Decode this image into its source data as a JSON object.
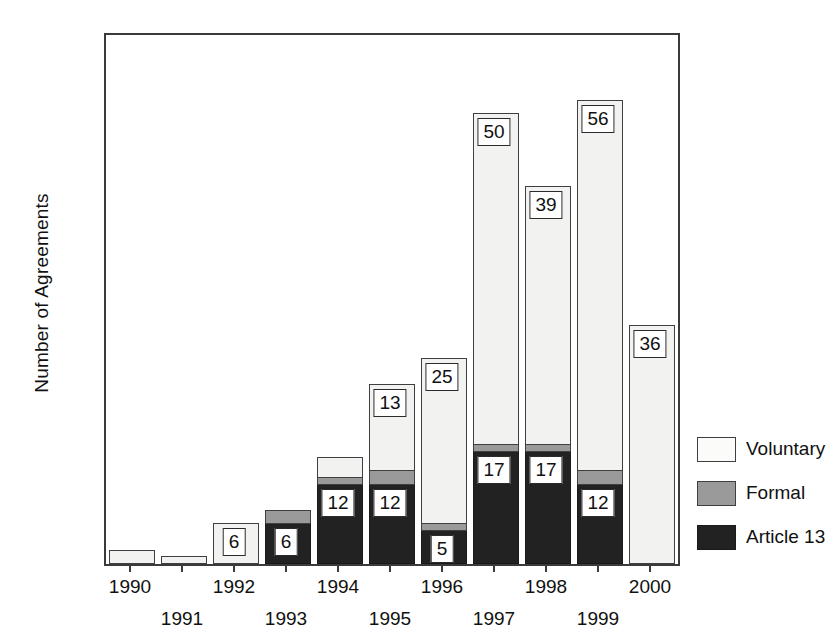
{
  "chart_data": {
    "type": "bar",
    "subtype": "stacked",
    "title": "",
    "xlabel": "",
    "ylabel": "Number of Agreements",
    "ylim": [
      0,
      80
    ],
    "yticks": [
      0,
      20,
      40,
      60,
      80
    ],
    "grid": false,
    "legend_position": "right",
    "categories": [
      "1990",
      "1991",
      "1992",
      "1993",
      "1994",
      "1995",
      "1996",
      "1997",
      "1998",
      "1999",
      "2000"
    ],
    "series": [
      {
        "name": "Article 13",
        "color": "#222222",
        "values": [
          0,
          0,
          0,
          6,
          12,
          12,
          5,
          17,
          17,
          12,
          0
        ],
        "labels": [
          "",
          "",
          "",
          "6",
          "12",
          "12",
          "5",
          "17",
          "17",
          "12",
          ""
        ]
      },
      {
        "name": "Formal",
        "color": "#9a9a9a",
        "values": [
          0,
          0,
          0,
          2,
          1,
          2,
          1,
          1,
          1,
          2,
          0
        ],
        "labels": [
          "",
          "",
          "",
          "",
          "",
          "",
          "",
          "",
          "",
          "",
          ""
        ]
      },
      {
        "name": "Voluntary",
        "color": "#f2f2f0",
        "values": [
          2,
          1,
          6,
          0,
          3,
          13,
          25,
          50,
          39,
          56,
          36
        ],
        "labels": [
          "",
          "",
          "6",
          "",
          "",
          "13",
          "25",
          "50",
          "39",
          "56",
          "36"
        ]
      }
    ],
    "totals": [
      2,
      1,
      6,
      8,
      16,
      27,
      31,
      68,
      57,
      70,
      36
    ]
  },
  "legend": {
    "items": [
      {
        "label": "Voluntary",
        "swatch": "voluntary"
      },
      {
        "label": "Formal",
        "swatch": "formal"
      },
      {
        "label": "Article 13",
        "swatch": "article13"
      }
    ]
  }
}
